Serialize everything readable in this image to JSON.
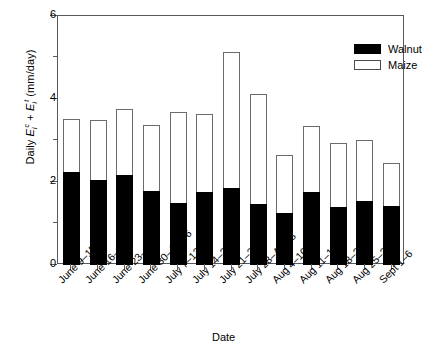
{
  "chart_data": {
    "type": "bar",
    "subtype": "stacked-vertical",
    "title": "",
    "xlabel": "Date",
    "ylabel": "Daily Eᵢᶜ + Eᵢᵗ (mm/day)",
    "ylabel_parts": {
      "prefix": "Daily ",
      "term1_base": "E",
      "term1_sup": "c",
      "term1_sub": "i",
      "operator": " + ",
      "term2_base": "E",
      "term2_sup": "t",
      "term2_sub": "i",
      "units": " (mm/day)"
    },
    "ylim": [
      0,
      6
    ],
    "yticks": [
      0,
      2,
      4,
      6
    ],
    "ytick_labels": [
      "0",
      "2",
      "4",
      "6"
    ],
    "yminor_ticks": [
      1,
      3,
      5
    ],
    "grid": false,
    "legend_position": "top-right",
    "categories": [
      "June 9–15",
      "June 16–22",
      "June 23–29",
      "June 30–July 6",
      "July 7–13",
      "July 14–20",
      "July 21–27",
      "July 28–Aug 3",
      "Aug 4–10",
      "Aug 11–17",
      "Aug 18–24",
      "Aug 25–31",
      "Sept 1–6"
    ],
    "series": [
      {
        "name": "Walnut",
        "color": "#000000",
        "style": "filled",
        "values": [
          2.25,
          2.04,
          2.17,
          1.78,
          1.49,
          1.77,
          1.85,
          1.47,
          1.25,
          1.76,
          1.4,
          1.54,
          1.42
        ]
      },
      {
        "name": "Maize",
        "color": "#ffffff",
        "style": "open",
        "values": [
          1.26,
          1.45,
          1.6,
          1.59,
          2.19,
          1.88,
          3.29,
          2.64,
          1.4,
          1.58,
          1.53,
          1.47,
          1.03
        ]
      }
    ],
    "totals": [
      3.51,
      3.49,
      3.77,
      3.37,
      3.68,
      3.65,
      5.14,
      4.11,
      2.65,
      3.34,
      2.93,
      3.01,
      2.45
    ]
  },
  "legend": {
    "items": [
      {
        "label": "Walnut",
        "swatch": "filled-black-rect"
      },
      {
        "label": "Maize",
        "swatch": "open-white-rect"
      }
    ]
  },
  "axes": {
    "y": {
      "title_plain": "Daily E i c + E i t (mm/day)",
      "tick_labels": [
        "0",
        "2",
        "4",
        "6"
      ]
    },
    "x": {
      "title": "Date",
      "tick_labels": [
        "June 9–15",
        "June 16–22",
        "June 23–29",
        "June 30–July 6",
        "July 7–13",
        "July 14–20",
        "July 21–27",
        "July 28–Aug 3",
        "Aug 4–10",
        "Aug 11–17",
        "Aug 18–24",
        "Aug 25–31",
        "Sept 1–6"
      ]
    }
  }
}
